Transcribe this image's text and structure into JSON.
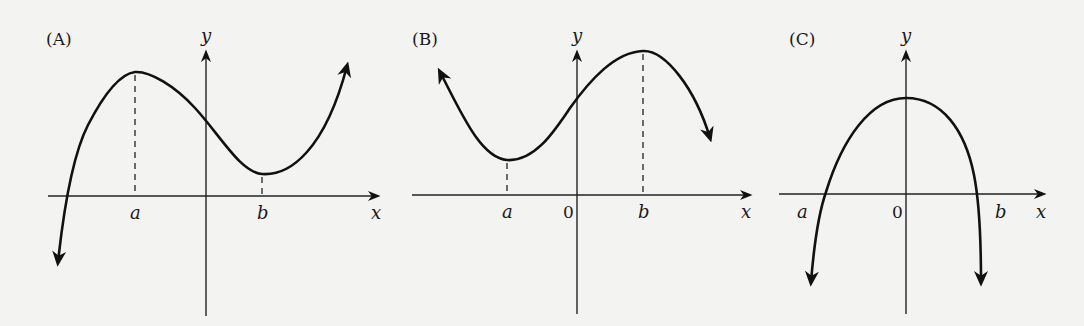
{
  "figure": {
    "panels": [
      {
        "id": "A",
        "label": "(A)",
        "x_axis_label": "x",
        "y_axis_label": "y",
        "tick_labels": {
          "a": "a",
          "b": "b",
          "origin": ""
        },
        "description": "Cubic with local maximum at x=a (a<0) and local minimum at x=b (b>0); rises to the right, falls to the left"
      },
      {
        "id": "B",
        "label": "(B)",
        "x_axis_label": "x",
        "y_axis_label": "y",
        "tick_labels": {
          "a": "a",
          "b": "b",
          "origin": "0"
        },
        "description": "Cubic with local minimum at x=a (a<0) and local maximum at x=b (b>0); rises to the left, falls to the right"
      },
      {
        "id": "C",
        "label": "(C)",
        "x_axis_label": "x",
        "y_axis_label": "y",
        "tick_labels": {
          "a": "a",
          "b": "b",
          "origin": "0"
        },
        "description": "Downward-opening curve with maximum on the y-axis, crossing the x-axis near x=a and x=b, both ends falling"
      }
    ],
    "colors": {
      "background": "#f3f3f1",
      "ink": "#111111"
    }
  }
}
